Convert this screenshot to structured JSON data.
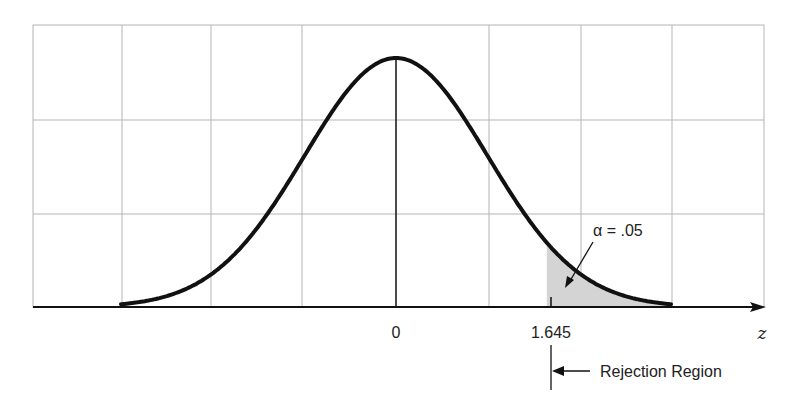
{
  "chart_data": {
    "type": "line",
    "xlabel": "z",
    "ylabel": "",
    "x_ticks": [
      {
        "value": 0,
        "label": "0"
      },
      {
        "value": 1.645,
        "label": "1.645"
      }
    ],
    "xlim": [
      -3,
      3
    ],
    "grid": true,
    "series": [
      {
        "name": "standard normal density",
        "distribution": "N(0,1)"
      }
    ],
    "shaded_region": {
      "from": 1.645,
      "to": 3,
      "area": 0.05
    },
    "annotations": [
      {
        "text": "α = .05",
        "points_to": "shaded tail area"
      },
      {
        "text": "Rejection Region",
        "marker": "arrow from z = 1.645 pointing right side"
      }
    ]
  },
  "labels": {
    "zero": "0",
    "critical": "1.645",
    "axis": "z",
    "alpha": "α = .05",
    "rejection": "Rejection Region"
  },
  "colors": {
    "curve": "#111111",
    "grid": "#b5b5b5",
    "shade": "#d4d4d4"
  }
}
